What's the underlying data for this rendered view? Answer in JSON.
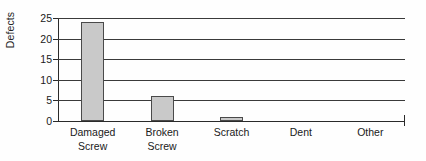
{
  "chart_data": {
    "type": "bar",
    "title": "",
    "xlabel": "",
    "ylabel": "Defects",
    "categories": [
      "Damaged Screw",
      "Broken Screw",
      "Scratch",
      "Dent",
      "Other"
    ],
    "category_lines": [
      [
        "Damaged",
        "Screw"
      ],
      [
        "Broken",
        "Screw"
      ],
      [
        "Scratch"
      ],
      [
        "Dent"
      ],
      [
        "Other"
      ]
    ],
    "values": [
      24,
      6,
      1,
      0,
      0
    ],
    "ylim": [
      0,
      25
    ],
    "yticks": [
      0,
      5,
      10,
      15,
      20,
      25
    ],
    "ytick_labels": [
      "0",
      "5",
      "10",
      "15",
      "20",
      "25"
    ],
    "grid": "horizontal",
    "legend": "none",
    "bar_fill": "#c9c9c9",
    "bar_border": "#4a4a4a",
    "axis_color": "#2a2a2a",
    "gridline_color": "#3a3a3a"
  }
}
